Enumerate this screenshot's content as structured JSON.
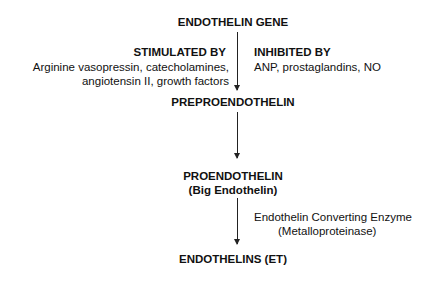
{
  "diagram": {
    "nodes": {
      "gene": "ENDOTHELIN GENE",
      "prepro": "PREPROENDOTHELIN",
      "pro": "PROENDOTHELIN",
      "pro_sub": "(Big Endothelin)",
      "final": "ENDOTHELINS (ET)"
    },
    "stimulated": {
      "title": "STIMULATED BY",
      "line1": "Arginine vasopressin, catecholamines,",
      "line2": "angiotensin II, growth factors"
    },
    "inhibited": {
      "title": "INHIBITED BY",
      "line1": "ANP, prostaglandins, NO"
    },
    "enzyme": {
      "line1": "Endothelin Converting Enzyme",
      "line2": "(Metalloproteinase)"
    }
  }
}
